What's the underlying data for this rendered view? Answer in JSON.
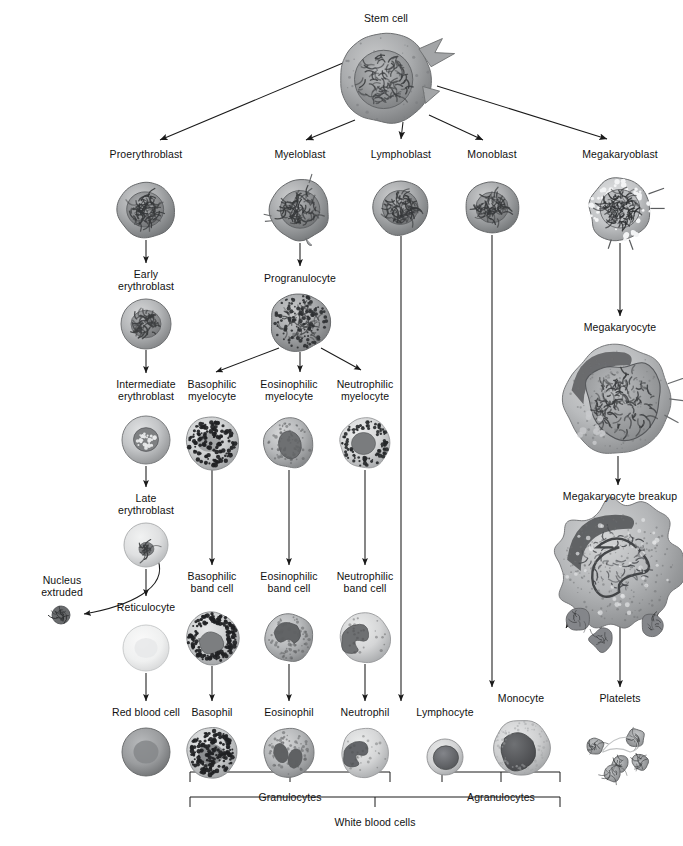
{
  "diagram": {
    "colors": {
      "ink": "#111111",
      "line": "#1a1a1a",
      "cell_dark": "#4b4b4b",
      "cell_mid": "#8e8e8e",
      "cell_light": "#cfcfcf",
      "background": "#ffffff"
    }
  },
  "nodes": [
    {
      "id": "stem_cell",
      "label": "Stem cell",
      "x": 386,
      "y": 12,
      "cx": 386,
      "cy": 78,
      "r": 47,
      "kind": "stemcell"
    },
    {
      "id": "proerythroblast",
      "label": "Proerythroblast",
      "x": 146,
      "y": 148,
      "cx": 146,
      "cy": 210,
      "r": 28,
      "kind": "blast-dark"
    },
    {
      "id": "myeloblast",
      "label": "Myeloblast",
      "x": 300,
      "y": 148,
      "cx": 300,
      "cy": 210,
      "r": 30,
      "kind": "blast-ruffled"
    },
    {
      "id": "lymphoblast",
      "label": "Lymphoblast",
      "x": 401,
      "y": 148,
      "cx": 401,
      "cy": 208,
      "r": 27,
      "kind": "blast-dark"
    },
    {
      "id": "monoblast",
      "label": "Monoblast",
      "x": 492,
      "y": 148,
      "cx": 492,
      "cy": 208,
      "r": 26,
      "kind": "blast-mid"
    },
    {
      "id": "megakaryoblast",
      "label": "Megakaryoblast",
      "x": 620,
      "y": 148,
      "cx": 620,
      "cy": 210,
      "r": 31,
      "kind": "megakaryoblast"
    },
    {
      "id": "early_erythroblast",
      "label": "Early\nerythroblast",
      "x": 146,
      "y": 268,
      "cx": 146,
      "cy": 324,
      "r": 25,
      "kind": "ery-early"
    },
    {
      "id": "progranulocyte",
      "label": "Progranulocyte",
      "x": 300,
      "y": 272,
      "cx": 300,
      "cy": 322,
      "r": 29,
      "kind": "progranulocyte"
    },
    {
      "id": "intermediate_eryth",
      "label": "Intermediate\nerythroblast",
      "x": 146,
      "y": 378,
      "cx": 146,
      "cy": 440,
      "r": 24,
      "kind": "ery-intermediate"
    },
    {
      "id": "basophilic_myelocyte",
      "label": "Basophilic\nmyelocyte",
      "x": 212,
      "y": 378,
      "cx": 212,
      "cy": 443,
      "r": 26,
      "kind": "baso-granular"
    },
    {
      "id": "eosinophilic_myelocyte",
      "label": "Eosinophilic\nmyelocyte",
      "x": 289,
      "y": 378,
      "cx": 289,
      "cy": 443,
      "r": 25,
      "kind": "eos-myelocyte"
    },
    {
      "id": "neutrophilic_myelocyte",
      "label": "Neutrophilic\nmyelocyte",
      "x": 365,
      "y": 378,
      "cx": 365,
      "cy": 443,
      "r": 25,
      "kind": "neut-myelocyte"
    },
    {
      "id": "late_erythroblast",
      "label": "Late\nerythroblast",
      "x": 146,
      "y": 492,
      "cx": 146,
      "cy": 545,
      "r": 22,
      "kind": "ery-late"
    },
    {
      "id": "nucleus_extruded",
      "label": "Nucleus\nextruded",
      "x": 62,
      "y": 574,
      "cx": 61,
      "cy": 615,
      "r": 9,
      "kind": "nucleus"
    },
    {
      "id": "reticulocyte",
      "label": "Reticulocyte",
      "x": 146,
      "y": 601,
      "cx": 146,
      "cy": 648,
      "r": 23,
      "kind": "reticulocyte"
    },
    {
      "id": "basophilic_band_cell",
      "label": "Basophilic\nband cell",
      "x": 212,
      "y": 570,
      "cx": 212,
      "cy": 638,
      "r": 26,
      "kind": "baso-band"
    },
    {
      "id": "eosinophilic_band_cell",
      "label": "Eosinophilic\nband cell",
      "x": 289,
      "y": 570,
      "cx": 289,
      "cy": 638,
      "r": 24,
      "kind": "eos-band"
    },
    {
      "id": "neutrophilic_band_cell",
      "label": "Neutrophilic\nband cell",
      "x": 365,
      "y": 570,
      "cx": 365,
      "cy": 638,
      "r": 25,
      "kind": "neut-band"
    },
    {
      "id": "red_blood_cell",
      "label": "Red blood cell",
      "x": 146,
      "y": 706,
      "cx": 146,
      "cy": 752,
      "r": 24,
      "kind": "rbc"
    },
    {
      "id": "basophil",
      "label": "Basophil",
      "x": 212,
      "y": 706,
      "cx": 212,
      "cy": 753,
      "r": 25,
      "kind": "basophil"
    },
    {
      "id": "eosinophil",
      "label": "Eosinophil",
      "x": 289,
      "y": 706,
      "cx": 289,
      "cy": 753,
      "r": 24,
      "kind": "eosinophil"
    },
    {
      "id": "neutrophil",
      "label": "Neutrophil",
      "x": 365,
      "y": 706,
      "cx": 365,
      "cy": 753,
      "r": 24,
      "kind": "neutrophil"
    },
    {
      "id": "lymphocyte",
      "label": "Lymphocyte",
      "x": 445,
      "y": 706,
      "cx": 445,
      "cy": 757,
      "r": 18,
      "kind": "lymphocyte"
    },
    {
      "id": "monocyte",
      "label": "Monocyte",
      "x": 521,
      "y": 692,
      "cx": 521,
      "cy": 748,
      "r": 28,
      "kind": "monocyte"
    },
    {
      "id": "megakaryocyte",
      "label": "Megakaryocyte",
      "x": 620,
      "y": 321,
      "cx": 618,
      "cy": 400,
      "r": 54,
      "kind": "megakaryocyte"
    },
    {
      "id": "megakaryocyte_breakup",
      "label": "Megakaryocyte breakup",
      "x": 620,
      "y": 490,
      "cx": 618,
      "cy": 566,
      "r": 62,
      "kind": "megakaryocyte-breakup"
    },
    {
      "id": "platelets",
      "label": "Platelets",
      "x": 620,
      "y": 692,
      "cx": 620,
      "cy": 752,
      "r": 34,
      "kind": "platelets"
    }
  ],
  "brackets": [
    {
      "id": "granulocytes",
      "label": "Granulocytes",
      "x1": 190,
      "x2": 390,
      "y": 787,
      "label_x": 290,
      "label_y": 791
    },
    {
      "id": "agranulocytes",
      "label": "Agranulocytes",
      "x1": 442,
      "x2": 560,
      "y": 787,
      "label_x": 501,
      "label_y": 791
    },
    {
      "id": "white_blood_cells",
      "label": "White blood cells",
      "x1": 190,
      "x2": 560,
      "y": 812,
      "label_x": 375,
      "label_y": 816
    }
  ],
  "labels_list": [
    "Stem cell",
    "Proerythroblast",
    "Myeloblast",
    "Lymphoblast",
    "Monoblast",
    "Megakaryoblast",
    "Early erythroblast",
    "Progranulocyte",
    "Intermediate erythroblast",
    "Basophilic myelocyte",
    "Eosinophilic myelocyte",
    "Neutrophilic myelocyte",
    "Late erythroblast",
    "Nucleus extruded",
    "Reticulocyte",
    "Basophilic band cell",
    "Eosinophilic band cell",
    "Neutrophilic band cell",
    "Red blood cell",
    "Basophil",
    "Eosinophil",
    "Neutrophil",
    "Lymphocyte",
    "Monocyte",
    "Megakaryocyte",
    "Megakaryocyte breakup",
    "Platelets",
    "Granulocytes",
    "Agranulocytes",
    "White blood cells"
  ]
}
